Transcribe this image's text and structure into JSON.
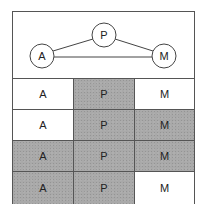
{
  "diagram": {
    "nodes": [
      {
        "id": "A",
        "label": "A",
        "cx": 29,
        "cy": 44,
        "r": 12
      },
      {
        "id": "P",
        "label": "P",
        "cx": 91,
        "cy": 23,
        "r": 12
      },
      {
        "id": "M",
        "label": "M",
        "cx": 151,
        "cy": 44,
        "r": 12
      }
    ],
    "edges": [
      {
        "from": "A",
        "to": "P"
      },
      {
        "from": "P",
        "to": "M"
      },
      {
        "from": "A",
        "to": "M"
      }
    ]
  },
  "grid": {
    "colors": {
      "shaded": "#a9a9a9",
      "unshaded": "#ffffff"
    },
    "rows": [
      {
        "cells": [
          {
            "label": "A",
            "shaded": false
          },
          {
            "label": "P",
            "shaded": true
          },
          {
            "label": "M",
            "shaded": false
          }
        ]
      },
      {
        "cells": [
          {
            "label": "A",
            "shaded": false
          },
          {
            "label": "P",
            "shaded": true
          },
          {
            "label": "M",
            "shaded": true
          }
        ]
      },
      {
        "cells": [
          {
            "label": "A",
            "shaded": true
          },
          {
            "label": "P",
            "shaded": true
          },
          {
            "label": "M",
            "shaded": true
          }
        ]
      },
      {
        "cells": [
          {
            "label": "A",
            "shaded": true
          },
          {
            "label": "P",
            "shaded": true
          },
          {
            "label": "M",
            "shaded": false
          }
        ]
      }
    ]
  }
}
